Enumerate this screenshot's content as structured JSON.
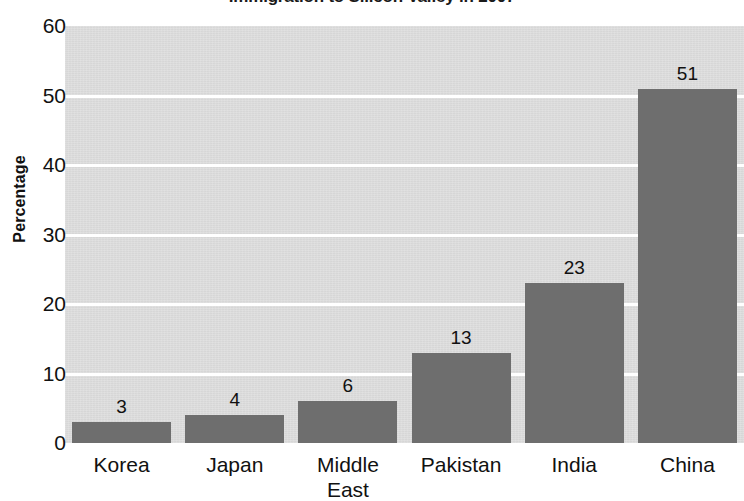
{
  "chart_data": {
    "type": "bar",
    "title": "Immigration to Silicon Valley in 2007",
    "xlabel": "",
    "ylabel": "Percentage",
    "categories": [
      "Korea",
      "Japan",
      "Middle East",
      "Pakistan",
      "India",
      "China"
    ],
    "values": [
      3,
      4,
      6,
      13,
      23,
      51
    ],
    "value_labels": [
      "3",
      "4",
      "6",
      "13",
      "23",
      "51"
    ],
    "ylim": [
      0,
      60
    ],
    "yticks": [
      0,
      10,
      20,
      30,
      40,
      50,
      60
    ],
    "ytick_labels": [
      "0",
      "10",
      "20",
      "30",
      "40",
      "50",
      "60"
    ],
    "grid": true,
    "grid_axis": "y",
    "grid_color": "#ffffff",
    "legend": false,
    "legend_position": "none",
    "bar_color": "#6e6e6e",
    "plot_background": "#dcdcdc",
    "figure_background": "#ffffff",
    "series": [
      {
        "name": "Percentage",
        "values": [
          3,
          4,
          6,
          13,
          23,
          51
        ]
      }
    ]
  },
  "category_lines": [
    [
      "Korea"
    ],
    [
      "Japan"
    ],
    [
      "Middle",
      "East"
    ],
    [
      "Pakistan"
    ],
    [
      "India"
    ],
    [
      "China"
    ]
  ]
}
